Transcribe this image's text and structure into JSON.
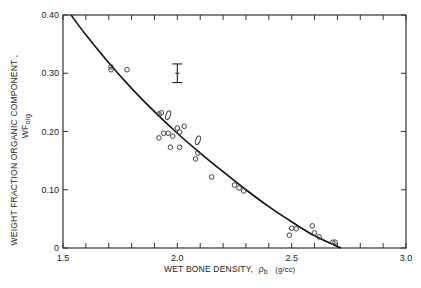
{
  "chart_data": {
    "type": "scatter",
    "title": "",
    "xlabel": "WET BONE DENSITY, ρb (g/cc)",
    "xlabel_parts": {
      "main": "WET BONE DENSITY,",
      "symbol": "ρ",
      "subscript": "b",
      "unit": "(g/cc)"
    },
    "ylabel": "WEIGHT FRACTION ORGANIC COMPONENT, WForg",
    "ylabel_parts": {
      "line1": "WEIGHT FRACTION ORGANIC COMPONENT ,",
      "line2_main": "WF",
      "line2_sub": "org"
    },
    "xlim": [
      1.5,
      3.0
    ],
    "ylim": [
      0,
      0.4
    ],
    "x_ticks": [
      1.5,
      2.0,
      2.5,
      3.0
    ],
    "x_tick_labels": [
      "1.5",
      "2.0",
      "2.5",
      "3.0"
    ],
    "x_minor_step": 0.1,
    "y_ticks": [
      0,
      0.1,
      0.2,
      0.3,
      0.4
    ],
    "y_tick_labels": [
      "0",
      "0.10",
      "0.20",
      "0.30",
      "0.40"
    ],
    "grid": false,
    "legend": null,
    "series": [
      {
        "name": "measured samples",
        "type": "scatter",
        "marker": "open-circle",
        "points": [
          {
            "x": 1.71,
            "y": 0.311
          },
          {
            "x": 1.71,
            "y": 0.306
          },
          {
            "x": 1.78,
            "y": 0.306
          },
          {
            "x": 1.92,
            "y": 0.23
          },
          {
            "x": 1.93,
            "y": 0.232
          },
          {
            "x": 1.92,
            "y": 0.189
          },
          {
            "x": 1.94,
            "y": 0.197
          },
          {
            "x": 1.96,
            "y": 0.197
          },
          {
            "x": 1.98,
            "y": 0.192
          },
          {
            "x": 1.97,
            "y": 0.173
          },
          {
            "x": 2.01,
            "y": 0.173
          },
          {
            "x": 2.0,
            "y": 0.206
          },
          {
            "x": 2.01,
            "y": 0.199
          },
          {
            "x": 2.03,
            "y": 0.209
          },
          {
            "x": 2.09,
            "y": 0.163
          },
          {
            "x": 2.08,
            "y": 0.153
          },
          {
            "x": 2.15,
            "y": 0.122
          },
          {
            "x": 2.25,
            "y": 0.108
          },
          {
            "x": 2.27,
            "y": 0.103
          },
          {
            "x": 2.29,
            "y": 0.098
          },
          {
            "x": 2.49,
            "y": 0.022
          },
          {
            "x": 2.5,
            "y": 0.034
          },
          {
            "x": 2.52,
            "y": 0.033
          },
          {
            "x": 2.59,
            "y": 0.038
          },
          {
            "x": 2.6,
            "y": 0.026
          },
          {
            "x": 2.62,
            "y": 0.019
          },
          {
            "x": 2.68,
            "y": 0.01
          },
          {
            "x": 2.69,
            "y": 0.01
          }
        ]
      },
      {
        "name": "multiple overlapping samples",
        "type": "scatter",
        "marker": "open-ellipse",
        "points": [
          {
            "x": 1.96,
            "y": 0.228
          },
          {
            "x": 2.09,
            "y": 0.185
          }
        ]
      },
      {
        "name": "fitted curve",
        "type": "line",
        "points": [
          {
            "x": 1.535,
            "y": 0.4
          },
          {
            "x": 1.6,
            "y": 0.366
          },
          {
            "x": 1.7,
            "y": 0.318
          },
          {
            "x": 1.8,
            "y": 0.274
          },
          {
            "x": 1.9,
            "y": 0.234
          },
          {
            "x": 2.0,
            "y": 0.197
          },
          {
            "x": 2.1,
            "y": 0.163
          },
          {
            "x": 2.2,
            "y": 0.131
          },
          {
            "x": 2.3,
            "y": 0.1
          },
          {
            "x": 2.4,
            "y": 0.071
          },
          {
            "x": 2.5,
            "y": 0.045
          },
          {
            "x": 2.6,
            "y": 0.021
          },
          {
            "x": 2.716,
            "y": 0.0
          }
        ]
      }
    ],
    "annotations": [
      {
        "type": "error-bar",
        "x": 2.0,
        "y_center": 0.3,
        "y_low": 0.284,
        "y_high": 0.316,
        "description": "representative uncertainty"
      }
    ]
  }
}
